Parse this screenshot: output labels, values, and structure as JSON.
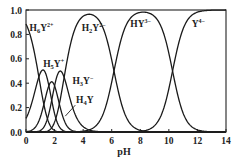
{
  "chart_data": {
    "type": "line",
    "title": "",
    "xlabel": "pH",
    "ylabel": "",
    "xlim": [
      0,
      14
    ],
    "ylim": [
      0,
      1.0
    ],
    "grid": false,
    "legend": "inline labels",
    "x_ticks": [
      "0",
      "2",
      "4",
      "6",
      "8",
      "10",
      "12",
      "14"
    ],
    "y_ticks": [
      "0.0",
      "0.2",
      "0.4",
      "0.6",
      "0.8",
      "1.0"
    ],
    "pKa": [
      0.9,
      1.6,
      2.0,
      2.67,
      6.16,
      10.26
    ],
    "x": [
      0,
      1,
      2,
      3,
      4,
      5,
      6,
      7,
      8,
      9,
      10,
      11,
      12,
      13,
      14
    ],
    "series": [
      {
        "name": "H6Y2+",
        "label_main": "H",
        "label_sub": "6",
        "label_y": "Y",
        "label_sup": "2+",
        "values": [
          0.87,
          0.39,
          0.06,
          0.0,
          0.0,
          0,
          0,
          0,
          0,
          0,
          0,
          0,
          0,
          0,
          0
        ]
      },
      {
        "name": "H5Y+",
        "label_main": "H",
        "label_sub": "5",
        "label_y": "Y",
        "label_sup": "+",
        "values": [
          0.11,
          0.49,
          0.48,
          0.09,
          0.0,
          0,
          0,
          0,
          0,
          0,
          0,
          0,
          0,
          0,
          0
        ]
      },
      {
        "name": "H4Y",
        "label_main": "H",
        "label_sub": "4",
        "label_y": "Y",
        "label_sup": "",
        "values": [
          0.02,
          0.1,
          0.19,
          0.18,
          0.02,
          0.0,
          0,
          0,
          0,
          0,
          0,
          0,
          0,
          0,
          0
        ]
      },
      {
        "name": "H3Y-",
        "label_main": "H",
        "label_sub": "3",
        "label_y": "Y",
        "label_sup": "−",
        "values": [
          0.0,
          0.02,
          0.27,
          0.49,
          0.17,
          0.02,
          0.0,
          0,
          0,
          0,
          0,
          0,
          0,
          0,
          0
        ]
      },
      {
        "name": "H2Y2-",
        "label_main": "H",
        "label_sub": "2",
        "label_y": "Y",
        "label_sup": "2−",
        "values": [
          0.0,
          0.0,
          0.0,
          0.24,
          0.81,
          0.92,
          0.58,
          0.13,
          0.01,
          0.0,
          0,
          0,
          0,
          0,
          0
        ]
      },
      {
        "name": "HY3-",
        "label_main": "H",
        "label_sub": "",
        "label_y": "Y",
        "label_sup": "3−",
        "values": [
          0,
          0,
          0,
          0,
          0.01,
          0.07,
          0.41,
          0.86,
          0.94,
          0.95,
          0.64,
          0.15,
          0.02,
          0.0,
          0.0
        ]
      },
      {
        "name": "Y4-",
        "label_main": "",
        "label_sub": "",
        "label_y": "Y",
        "label_sup": "4−",
        "values": [
          0,
          0,
          0,
          0,
          0,
          0,
          0,
          0.0,
          0.01,
          0.05,
          0.35,
          0.85,
          0.98,
          1.0,
          1.0
        ]
      }
    ]
  },
  "labels": {
    "H6Y": {
      "x": 0.25,
      "y": 0.83
    },
    "H5Y": {
      "x": 1.2,
      "y": 0.53
    },
    "H3Y": {
      "x": 3.25,
      "y": 0.39
    },
    "H4Y": {
      "x": 3.5,
      "y": 0.24
    },
    "H2Y": {
      "x": 3.9,
      "y": 0.83
    },
    "HY": {
      "x": 7.3,
      "y": 0.86
    },
    "Y": {
      "x": 11.6,
      "y": 0.86
    }
  },
  "axis_title": "pH"
}
